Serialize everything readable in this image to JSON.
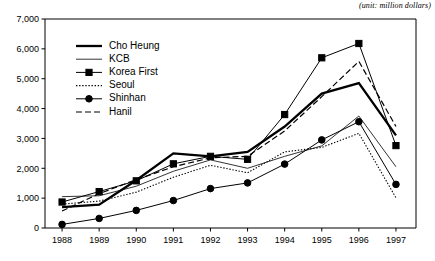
{
  "unit_note": "(unit: million dollars)",
  "chart_data": {
    "type": "line",
    "title": "",
    "subtitle": "",
    "xlabel": "",
    "ylabel": "",
    "unit_label": "(unit: million dollars)",
    "categories": [
      "1988",
      "1989",
      "1990",
      "1991",
      "1992",
      "1993",
      "1994",
      "1995",
      "1996",
      "1997"
    ],
    "x": [
      1988,
      1989,
      1990,
      1991,
      1992,
      1993,
      1994,
      1995,
      1996,
      1997
    ],
    "ylim": [
      0,
      7000
    ],
    "ytick_labels": [
      "0",
      "1,000",
      "2,000",
      "3,000",
      "4,000",
      "5,000",
      "6,000",
      "7,000"
    ],
    "ytick_values": [
      0,
      1000,
      2000,
      3000,
      4000,
      5000,
      6000,
      7000
    ],
    "grid": false,
    "legend_position": "upper-left-inside",
    "series": [
      {
        "name": "Cho Heung",
        "style": "thick-solid",
        "marker": "none",
        "color": "#000000",
        "values": [
          700,
          780,
          1600,
          2500,
          2400,
          2550,
          3400,
          4500,
          4850,
          3100
        ]
      },
      {
        "name": "KCB",
        "style": "thin-solid",
        "marker": "none",
        "color": "#000000",
        "values": [
          1050,
          1080,
          1400,
          1900,
          2280,
          2000,
          2400,
          2750,
          3750,
          2050
        ]
      },
      {
        "name": "Korea First",
        "style": "solid",
        "marker": "square",
        "color": "#000000",
        "values": [
          870,
          1220,
          1580,
          2150,
          2400,
          2300,
          3800,
          5700,
          6180,
          2760
        ]
      },
      {
        "name": "Seoul",
        "style": "dotted",
        "marker": "none",
        "color": "#000000",
        "values": [
          800,
          900,
          1200,
          1700,
          2100,
          1850,
          2550,
          2700,
          3170,
          1010
        ]
      },
      {
        "name": "Shinhan",
        "style": "solid",
        "marker": "circle",
        "color": "#000000",
        "values": [
          120,
          320,
          590,
          920,
          1320,
          1510,
          2140,
          2950,
          3560,
          1460
        ]
      },
      {
        "name": "Hanil",
        "style": "dashed",
        "marker": "none",
        "color": "#000000",
        "values": [
          570,
          1150,
          1620,
          2050,
          2350,
          2400,
          3250,
          4400,
          5580,
          3400
        ]
      }
    ]
  }
}
